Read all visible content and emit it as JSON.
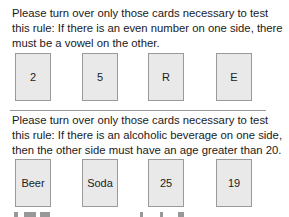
{
  "problems": [
    {
      "instruction": "Please turn over only those cards necessary to test this rule:  If there is an even number on one side, there must be a vowel on the other.",
      "cards": [
        "2",
        "5",
        "R",
        "E"
      ]
    },
    {
      "instruction": "Please turn over only those cards necessary to test this rule:  If there is an alcoholic beverage on one side, then the other side must have an age greater than 20.",
      "cards": [
        "Beer",
        "Soda",
        "25",
        "19"
      ]
    }
  ],
  "colors": {
    "card_fill": "#e9e9e9",
    "card_border": "#9a9a9a",
    "text": "#1a1a1a"
  }
}
